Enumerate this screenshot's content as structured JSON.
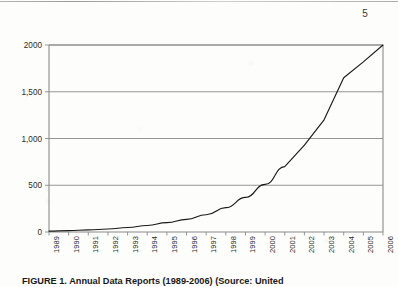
{
  "page": {
    "number": "5"
  },
  "figure": {
    "caption": "FIGURE 1. Annual Data Reports (1989-2006) (Source: United"
  },
  "chart_data": {
    "type": "line",
    "title": "",
    "subtitle": "",
    "xlabel": "",
    "ylabel": "",
    "grid": true,
    "legend": "none",
    "line_color": "#1a1a1a",
    "axis_color": "#8a8a8a",
    "grid_color": "#8a8a8a",
    "ylim": [
      0,
      2000
    ],
    "xlim": [
      "1989",
      "2006"
    ],
    "ytick_labels": [
      "0",
      "500",
      "1,000",
      "1,500",
      "2000"
    ],
    "ytick_values": [
      0,
      500,
      1000,
      1500,
      2000
    ],
    "categories": [
      "1989",
      "1990",
      "1991",
      "1992",
      "1993",
      "1994",
      "1995",
      "1996",
      "1997",
      "1998",
      "1999",
      "2000",
      "2001",
      "2002",
      "2003",
      "2004",
      "2005",
      "2006"
    ],
    "values": [
      10,
      15,
      22,
      32,
      48,
      70,
      100,
      135,
      185,
      260,
      370,
      510,
      700,
      930,
      1200,
      1650,
      1820,
      2000
    ]
  }
}
